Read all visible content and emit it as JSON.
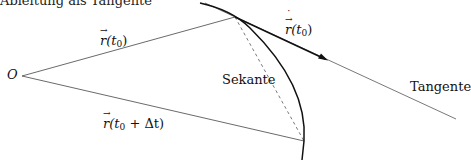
{
  "diagram": {
    "caption_partial": "Ableitung als Tangente",
    "points": {
      "origin": {
        "label": "O",
        "x": 22,
        "y": 76
      },
      "p0": {
        "x": 235,
        "y": 17
      },
      "p1": {
        "x": 304,
        "y": 141
      }
    },
    "labels": {
      "origin": "O",
      "r_t0_vec": "r",
      "r_t0_arg_open": "(t",
      "r_t0_sub": "0",
      "r_t0_arg_close": ")",
      "rdot_vec": "r",
      "rdot_arg_open": "(t",
      "rdot_sub": "0",
      "rdot_arg_close": ")",
      "r_dt_vec": "r",
      "r_dt_arg_open": "(t",
      "r_dt_sub": "0",
      "r_dt_arg_rest": " + Δt)",
      "secant": "Sekante",
      "tangent": "Tangente"
    },
    "colors": {
      "line": "#333333",
      "curve": "#111111",
      "background": "#ffffff"
    }
  }
}
